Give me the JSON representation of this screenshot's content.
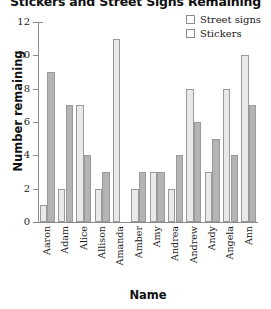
{
  "chart_data": {
    "type": "bar",
    "title": "Stickers and Street Signs Remaining",
    "xlabel": "Name",
    "ylabel": "Number remaining",
    "categories": [
      "Aaron",
      "Adam",
      "Alice",
      "Allison",
      "Amanda",
      "Amber",
      "Amy",
      "Andrea",
      "Andrew",
      "Andy",
      "Angela",
      "Ann"
    ],
    "series": [
      {
        "name": "Street signs",
        "color": "#e9e9e9",
        "values": [
          1,
          2,
          7,
          2,
          11,
          2,
          3,
          2,
          8,
          3,
          8,
          10
        ]
      },
      {
        "name": "Stickers",
        "color": "#b4b4b4",
        "values": [
          9,
          7,
          4,
          3,
          0,
          3,
          3,
          4,
          6,
          5,
          4,
          7
        ]
      }
    ],
    "ylim": [
      0,
      12
    ],
    "yticks": [
      0,
      2,
      4,
      6,
      8,
      10,
      12
    ],
    "ytick_labels": [
      "0",
      "2",
      "4",
      "6",
      "8",
      "10",
      "12"
    ],
    "grid": false,
    "legend_position": "top-right"
  }
}
